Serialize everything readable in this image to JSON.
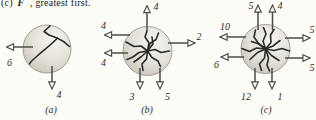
{
  "caption": {
    "prefix": "(c)",
    "symbol": "F",
    "vector_arrow": "→",
    "suffix": ", greatest first."
  },
  "panels": [
    {
      "label": "(a)",
      "arrows": [
        {
          "name": "left",
          "value": "6"
        },
        {
          "name": "down",
          "value": "4"
        }
      ]
    },
    {
      "label": "(b)",
      "arrows": [
        {
          "name": "up",
          "value": "4"
        },
        {
          "name": "left-upper",
          "value": "4"
        },
        {
          "name": "left-lower",
          "value": "4"
        },
        {
          "name": "right",
          "value": "2"
        },
        {
          "name": "down-left",
          "value": "3"
        },
        {
          "name": "down-right",
          "value": "5"
        }
      ]
    },
    {
      "label": "(c)",
      "arrows": [
        {
          "name": "up-left",
          "value": "5"
        },
        {
          "name": "up-right",
          "value": "4"
        },
        {
          "name": "left-upper",
          "value": "10"
        },
        {
          "name": "left-lower",
          "value": "6"
        },
        {
          "name": "right-upper",
          "value": "5"
        },
        {
          "name": "right-lower",
          "value": "5"
        },
        {
          "name": "down-left",
          "value": "12"
        },
        {
          "name": "down-right",
          "value": "1"
        }
      ]
    }
  ],
  "colors": {
    "background": "#fcfbf5",
    "arrow": "#4c4c49",
    "crack": "#2b2b28",
    "label": "#2e2e2c",
    "sphere_highlight": "#f6f4ee",
    "sphere_mid": "#e3e0d8",
    "sphere_edge": "#a9a59b"
  }
}
